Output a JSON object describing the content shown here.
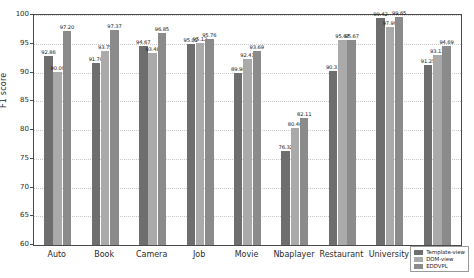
{
  "chart_data": {
    "type": "bar",
    "title": "",
    "xlabel": "",
    "ylabel": "F1 score",
    "ylim": [
      60,
      100
    ],
    "yticks": [
      60,
      65,
      70,
      75,
      80,
      85,
      90,
      95,
      100
    ],
    "grid": true,
    "legend_position": "bottom-right",
    "categories": [
      "Auto",
      "Book",
      "Camera",
      "Job",
      "Movie",
      "Nbaplayer",
      "Restaurant",
      "University",
      "Average"
    ],
    "series": [
      {
        "name": "Template-view",
        "color": "#6e6e6e",
        "values": [
          92.86,
          91.7,
          94.67,
          95.02,
          89.98,
          76.32,
          90.31,
          99.42,
          91.25
        ]
      },
      {
        "name": "DOM-view",
        "color": "#aaaaaa",
        "values": [
          90.09,
          93.75,
          93.48,
          95.12,
          92.41,
          80.4,
          95.67,
          97.99,
          93.13
        ]
      },
      {
        "name": "EDDVPL",
        "color": "#8b8b8b",
        "values": [
          97.2,
          97.37,
          96.85,
          95.76,
          93.69,
          82.11,
          95.67,
          99.65,
          94.69
        ]
      }
    ],
    "labels": [
      [
        "92.86",
        "90.09",
        "97.20"
      ],
      [
        "91.70",
        "93.75",
        "97.37"
      ],
      [
        "94.67",
        "93.48",
        "96.85"
      ],
      [
        "95.02",
        "95.12",
        "95.76"
      ],
      [
        "89.98",
        "92.41",
        "93.69"
      ],
      [
        "76.32",
        "80.40",
        "82.11"
      ],
      [
        "90.31",
        "95.67",
        "95.67"
      ],
      [
        "99.42",
        "97.99",
        "99.65"
      ],
      [
        "91.25",
        "93.13",
        "94.69"
      ]
    ]
  }
}
